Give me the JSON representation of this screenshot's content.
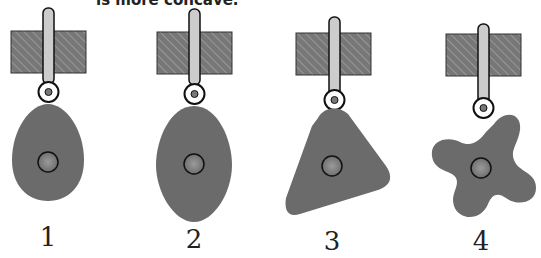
{
  "caption": {
    "text": "is more concave."
  },
  "colors": {
    "cam_fill": "#6b6b6b",
    "block_fill": "#777777",
    "hatch": "#9a9a9a",
    "rod_fill": "#cccccc",
    "outline": "#111111",
    "hub_fill": "#8a8a8a",
    "background": "#ffffff"
  },
  "figures": [
    {
      "id": 1,
      "label": "1",
      "shape": "egg-cam"
    },
    {
      "id": 2,
      "label": "2",
      "shape": "elliptical-cam"
    },
    {
      "id": 3,
      "label": "3",
      "shape": "triangular-cam"
    },
    {
      "id": 4,
      "label": "4",
      "shape": "four-lobe-cam"
    }
  ]
}
